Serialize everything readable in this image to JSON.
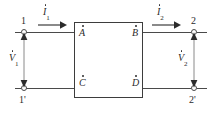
{
  "diagram": {
    "colors": {
      "wire": "#4a4a4a",
      "box_border": "#3d3d3d",
      "text": "#2b2b2b",
      "background": "#ffffff"
    },
    "terminals": [
      {
        "id": "t1",
        "label": "1",
        "position": "top-left"
      },
      {
        "id": "t1p",
        "label": "1'",
        "position": "bottom-left"
      },
      {
        "id": "t2",
        "label": "2",
        "position": "top-right"
      },
      {
        "id": "t2p",
        "label": "2'",
        "position": "bottom-right"
      }
    ],
    "nodes": [
      {
        "id": "A",
        "label": "A",
        "dot": true,
        "corner": "top-left"
      },
      {
        "id": "B",
        "label": "B",
        "dot": true,
        "corner": "top-right"
      },
      {
        "id": "C",
        "label": "C",
        "dot": true,
        "corner": "bottom-left"
      },
      {
        "id": "D",
        "label": "D",
        "dot": true,
        "corner": "bottom-right"
      }
    ],
    "currents": [
      {
        "id": "I1",
        "symbol": "I",
        "subscript": "1",
        "dot": true,
        "direction": "right"
      },
      {
        "id": "I2",
        "symbol": "I",
        "subscript": "2",
        "dot": true,
        "direction": "right"
      }
    ],
    "voltages": [
      {
        "id": "V1",
        "symbol": "V",
        "subscript": "1",
        "dot": true,
        "direction": "vertical-double"
      },
      {
        "id": "V2",
        "symbol": "V",
        "subscript": "2",
        "dot": true,
        "direction": "vertical-double"
      }
    ]
  }
}
